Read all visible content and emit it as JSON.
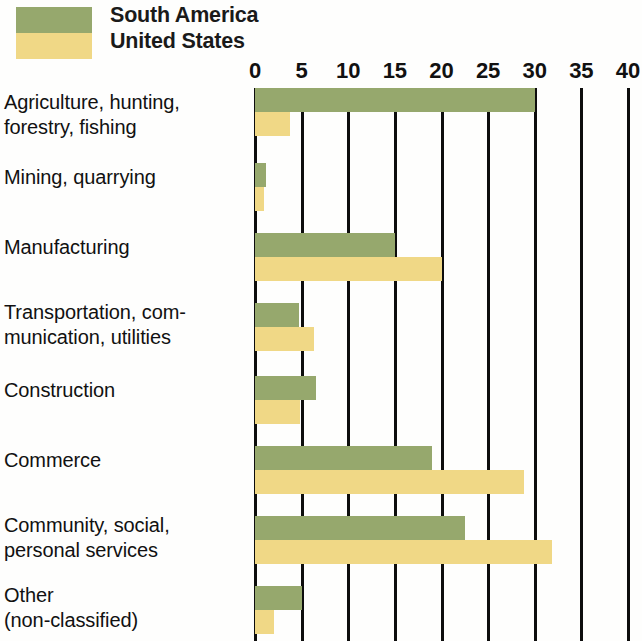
{
  "legend": {
    "items": [
      {
        "label": "South America",
        "color": "#96a86d",
        "swatch_name": "legend-swatch-south-america"
      },
      {
        "label": "United States",
        "color": "#f0d886",
        "swatch_name": "legend-swatch-united-states"
      }
    ]
  },
  "axis": {
    "ticks": [
      "0",
      "5",
      "10",
      "15",
      "20",
      "25",
      "30",
      "35",
      "40"
    ]
  },
  "chart_data": {
    "type": "bar",
    "orientation": "horizontal",
    "title": "",
    "xlabel": "",
    "ylabel": "",
    "xlim": [
      0,
      40
    ],
    "xticks": [
      0,
      5,
      10,
      15,
      20,
      25,
      30,
      35,
      40
    ],
    "grid": true,
    "legend_position": "top-left",
    "categories": [
      "Agriculture, hunting,\nforestry, fishing",
      "Mining, quarrying",
      "Manufacturing",
      "Transportation, com-\nmunication, utilities",
      "Construction",
      "Commerce",
      "Community, social,\npersonal services",
      "Other\n(non-classified)"
    ],
    "series": [
      {
        "name": "South America",
        "color": "#96a86d",
        "values": [
          30,
          1.2,
          15,
          4.7,
          6.5,
          19,
          22.5,
          5
        ]
      },
      {
        "name": "United States",
        "color": "#f0d886",
        "values": [
          3.8,
          1,
          20,
          6.3,
          4.8,
          28.8,
          31.8,
          2
        ]
      }
    ]
  },
  "rows": [
    {
      "label": "Agriculture, hunting,\nforestry, fishing",
      "name": "row-agriculture",
      "top": 0,
      "label_top": 2
    },
    {
      "label": "Mining, quarrying",
      "name": "row-mining",
      "top": 75,
      "label_top": 77
    },
    {
      "label": "Manufacturing",
      "name": "row-manufacturing",
      "top": 145,
      "label_top": 147
    },
    {
      "label": "Transportation, com-\nmunication, utilities",
      "name": "row-transportation",
      "top": 215,
      "label_top": 212
    },
    {
      "label": "Construction",
      "name": "row-construction",
      "top": 288,
      "label_top": 290
    },
    {
      "label": "Commerce",
      "name": "row-commerce",
      "top": 358,
      "label_top": 360
    },
    {
      "label": "Community, social,\npersonal services",
      "name": "row-community",
      "top": 428,
      "label_top": 425
    },
    {
      "label": "Other\n(non-classified)",
      "name": "row-other",
      "top": 498,
      "label_top": 495
    }
  ]
}
